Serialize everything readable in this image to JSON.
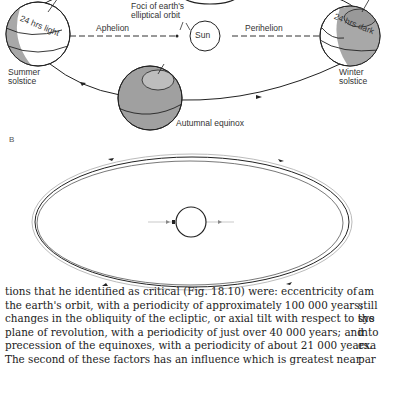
{
  "figure_a": {
    "labels": {
      "foci": [
        "Foci of earth's",
        "elliptical orbit"
      ],
      "aphelion": "Aphelion",
      "perihelion": "Perihelion",
      "sun": "Sun",
      "summer_light": "24 hrs light",
      "winter_dark": "24 hrs dark",
      "summer_solstice": [
        "Summer",
        "solstice"
      ],
      "winter_solstice": [
        "Winter",
        "solstice"
      ],
      "autumnal_equinox": "Autumnal equinox"
    }
  },
  "figure_b": {
    "panel_label": "B"
  },
  "body": {
    "lines": [
      "tions that he identified as critical (Fig. 18.10) were: eccentricity of",
      "the earth's orbit, with a periodicity of approximately 100 000 years;",
      "changes in the obliquity of the ecliptic, or axial tilt with respect to the",
      "plane of revolution, with a periodicity of just over 40 000 years; and",
      "precession of the equinoxes, with a periodicity of about 21 000 years.",
      "The second of these factors has an influence which is greatest near"
    ],
    "side_column": [
      "am",
      "still",
      "sys",
      "into",
      "exa",
      "par"
    ]
  }
}
